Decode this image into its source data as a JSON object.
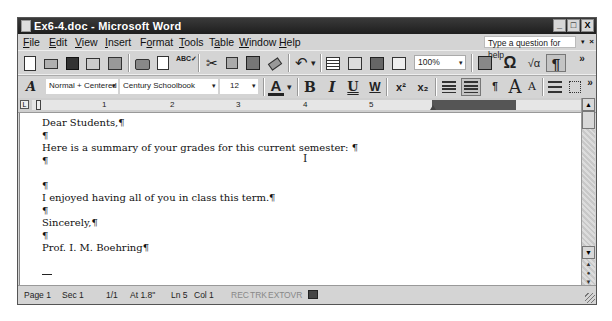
{
  "window": {
    "title": "Ex6-4.doc - Microsoft Word",
    "controls": {
      "minimize": "_",
      "maximize": "□",
      "close": "X"
    }
  },
  "menubar": {
    "items": [
      {
        "label": "File",
        "accel": "F",
        "rest": "ile"
      },
      {
        "label": "Edit",
        "accel": "E",
        "rest": "dit"
      },
      {
        "label": "View",
        "accel": "V",
        "rest": "iew"
      },
      {
        "label": "Insert",
        "accel": "I",
        "rest": "nsert"
      },
      {
        "label": "Format",
        "pre": "F",
        "accel": "o",
        "rest": "rmat"
      },
      {
        "label": "Tools",
        "accel": "T",
        "rest": "ools"
      },
      {
        "label": "Table",
        "pre": "T",
        "accel": "a",
        "rest": "ble"
      },
      {
        "label": "Window",
        "accel": "W",
        "rest": "indow"
      },
      {
        "label": "Help",
        "accel": "H",
        "rest": "elp"
      }
    ],
    "help_placeholder": "Type a question for help",
    "help_dropdown": "▾",
    "help_close": "×"
  },
  "standard_toolbar": {
    "icons": [
      "new-icon",
      "open-icon",
      "save-icon",
      "permission-icon",
      "email-icon",
      "print-icon",
      "print-preview-icon",
      "spelling-icon",
      "cut-icon",
      "copy-icon",
      "paste-icon",
      "format-painter-icon",
      "undo-icon",
      "undo-dropdown-icon",
      "insert-table-icon",
      "columns-icon",
      "document-map-icon",
      "reading-layout-icon"
    ],
    "zoom": "100%",
    "more_label": "»",
    "glyphs": {
      "omega": "Ω",
      "equation": "√α",
      "pilcrow": "¶",
      "undo": "↶",
      "dropdown": "▾",
      "cut": "✂",
      "spelling": "ABC✓"
    }
  },
  "formatting_toolbar": {
    "style": "Normal + Centered",
    "font": "Century Schoolbook",
    "size": "12",
    "glyphs": {
      "font_color": "A",
      "bold": "B",
      "italic": "I",
      "underline": "U",
      "double_underline": "W",
      "superscript": "x²",
      "subscript": "x₂",
      "grow_font": "A",
      "shrink_font": "A",
      "styles_icon": "A"
    },
    "more_label": "»"
  },
  "ruler": {
    "tab_selector": "L",
    "numbers": [
      "1",
      "2",
      "3",
      "4",
      "5"
    ]
  },
  "document": {
    "lines": [
      "Dear Students,¶",
      "¶",
      "Here is a summary of your grades for this current semester: ¶",
      "¶",
      "",
      "¶",
      "I enjoyed having all of you in class this term.¶",
      "¶",
      "Sincerely,¶",
      "¶",
      "Prof. I. M. Boehring¶"
    ],
    "ibeam_glyph": "I"
  },
  "scrollbar": {
    "up": "▲",
    "down": "▼",
    "prev_page": "▲",
    "select_browse": "●",
    "next_page": "▼"
  },
  "statusbar": {
    "page": "Page 1",
    "sec": "Sec 1",
    "pages": "1/1",
    "at": "At 1.8\"",
    "ln": "Ln 5",
    "col": "Col 1",
    "rec": "REC",
    "trk": "TRK",
    "ext": "EXT",
    "ovr": "OVR",
    "spell_icon": "spelling-status-icon"
  }
}
